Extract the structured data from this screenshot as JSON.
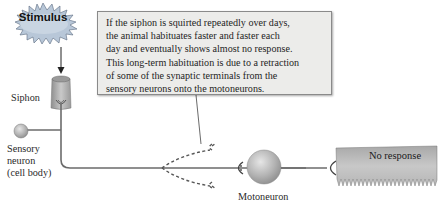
{
  "stimulus": {
    "label": "Stimulus",
    "burst_color": "#b8c7d8"
  },
  "callout": {
    "lines": [
      "If the siphon is squirted repeatedly over days,",
      "the animal habituates faster and faster each",
      "day and eventually shows almost no response.",
      "This long-term habituation is due to a retraction",
      "of some of the synaptic terminals from the",
      "sensory neurons onto the motoneurons."
    ]
  },
  "labels": {
    "siphon": "Siphon",
    "sensory_neuron": [
      "Sensory",
      "neuron",
      "(cell body)"
    ],
    "motoneuron": "Motoneuron",
    "response": "No response"
  },
  "colors": {
    "axon": "#6b6b6b",
    "cell_body": "#b5b5b5",
    "muscle": "#b0b0b0",
    "callout_bg": "#ececea"
  }
}
